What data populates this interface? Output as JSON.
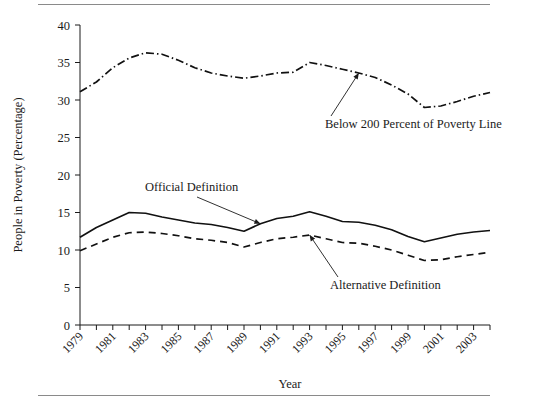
{
  "figure": {
    "background_color": "#ffffff",
    "line_color": "#111111",
    "rule_color": "#8a8a8a"
  },
  "chart_data": {
    "type": "line",
    "title": "",
    "xlabel": "Year",
    "ylabel": "People in Poverty (Percentage)",
    "xlim": [
      1979,
      2004
    ],
    "ylim": [
      0,
      40
    ],
    "yticks": [
      0,
      5,
      10,
      15,
      20,
      25,
      30,
      35,
      40
    ],
    "ytick_labels": [
      "0",
      "5",
      "10",
      "15",
      "20",
      "25",
      "30",
      "35",
      "40"
    ],
    "xticks": [
      1979,
      1980,
      1981,
      1982,
      1983,
      1984,
      1985,
      1986,
      1987,
      1988,
      1989,
      1990,
      1991,
      1992,
      1993,
      1994,
      1995,
      1996,
      1997,
      1998,
      1999,
      2000,
      2001,
      2002,
      2003,
      2004
    ],
    "xtick_labels_shown": [
      "1979",
      "1981",
      "1983",
      "1985",
      "1987",
      "1989",
      "1991",
      "1993",
      "1995",
      "1997",
      "1999",
      "2001",
      "2003"
    ],
    "grid": false,
    "legend_position": "inline-annotations",
    "x": [
      1979,
      1980,
      1981,
      1982,
      1983,
      1984,
      1985,
      1986,
      1987,
      1988,
      1989,
      1990,
      1991,
      1992,
      1993,
      1994,
      1995,
      1996,
      1997,
      1998,
      1999,
      2000,
      2001,
      2002,
      2003,
      2004
    ],
    "series": [
      {
        "name": "Below 200 Percent of Poverty Line",
        "style": "dash-dot",
        "values": [
          31.1,
          32.4,
          34.3,
          35.6,
          36.3,
          36.1,
          35.3,
          34.3,
          33.6,
          33.2,
          32.9,
          33.2,
          33.6,
          33.7,
          35.0,
          34.6,
          34.1,
          33.6,
          33.0,
          32.0,
          30.8,
          29.0,
          29.2,
          29.8,
          30.5,
          31.0
        ]
      },
      {
        "name": "Official Definition",
        "style": "solid",
        "values": [
          11.7,
          13.0,
          14.0,
          15.0,
          14.9,
          14.4,
          14.0,
          13.6,
          13.4,
          13.0,
          12.5,
          13.5,
          14.2,
          14.5,
          15.1,
          14.5,
          13.8,
          13.7,
          13.3,
          12.7,
          11.8,
          11.1,
          11.6,
          12.1,
          12.4,
          12.6
        ]
      },
      {
        "name": "Alternative Definition",
        "style": "dashed",
        "values": [
          9.9,
          10.8,
          11.7,
          12.3,
          12.4,
          12.2,
          11.9,
          11.5,
          11.3,
          11.0,
          10.4,
          11.0,
          11.5,
          11.7,
          12.0,
          11.5,
          11.0,
          10.9,
          10.5,
          10.0,
          9.3,
          8.6,
          8.7,
          9.1,
          9.4,
          9.7
        ]
      }
    ],
    "annotations": [
      {
        "text": "Below 200 Percent of Poverty Line",
        "target_x": 1996,
        "target_y": 33.6
      },
      {
        "text": "Official Definition",
        "target_x": 1990,
        "target_y": 13.5
      },
      {
        "text": "Alternative Definition",
        "target_x": 1993,
        "target_y": 12.0
      }
    ]
  }
}
